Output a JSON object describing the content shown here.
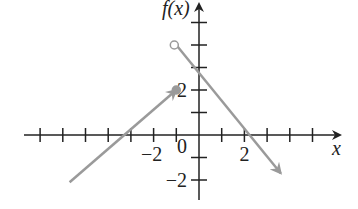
{
  "chart_data": {
    "type": "line",
    "title": "",
    "xlabel": "x",
    "ylabel": "f(x)",
    "xlim": [
      -7,
      6
    ],
    "ylim": [
      -3,
      5
    ],
    "x_tick_labels": [
      {
        "value": -2,
        "label": "−2"
      },
      {
        "value": 2,
        "label": "2"
      }
    ],
    "y_tick_labels": [
      {
        "value": 2,
        "label": "2"
      },
      {
        "value": -2,
        "label": "−2"
      }
    ],
    "origin_label": "0",
    "series": [
      {
        "name": "left piece",
        "points": [
          [
            -1,
            2
          ],
          [
            -3,
            0
          ],
          [
            -5.7,
            -2.1
          ]
        ],
        "end_left": "arrow",
        "end_right": "closed-dot",
        "color": "#9a9a9a"
      },
      {
        "name": "right piece",
        "points": [
          [
            -1,
            4
          ],
          [
            0,
            3
          ],
          [
            2,
            0
          ],
          [
            3.6,
            -1.7
          ]
        ],
        "end_left": "open-dot",
        "end_right": "arrow",
        "color": "#9a9a9a"
      }
    ],
    "grid": false
  }
}
